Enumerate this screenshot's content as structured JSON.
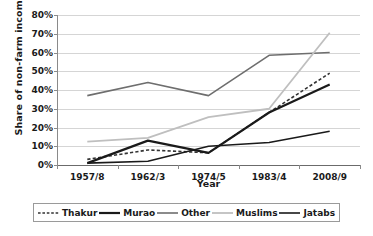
{
  "chart_data": {
    "type": "line",
    "title": "",
    "xlabel": "Year",
    "ylabel": "Share of non-farm income",
    "categories": [
      "1957/8",
      "1962/3",
      "1974/5",
      "1983/4",
      "2008/9"
    ],
    "ylim": [
      0,
      80
    ],
    "ytick_labels": [
      "0%",
      "10%",
      "20%",
      "30%",
      "40%",
      "50%",
      "60%",
      "70%",
      "80%"
    ],
    "ytick_values": [
      0,
      10,
      20,
      30,
      40,
      50,
      60,
      70,
      80
    ],
    "grid": true,
    "legend_position": "bottom",
    "series": [
      {
        "name": "Thakur",
        "style": "dashed",
        "color": "#333333",
        "width": 1.6,
        "values": [
          3,
          8,
          6.5,
          28,
          49
        ]
      },
      {
        "name": "Murao",
        "style": "solid",
        "color": "#1a1a1a",
        "width": 2.2,
        "values": [
          1,
          13,
          6.5,
          28,
          43
        ]
      },
      {
        "name": "Other",
        "style": "solid",
        "color": "#6e6e6e",
        "width": 1.6,
        "values": [
          37,
          44,
          37,
          58.5,
          60
        ]
      },
      {
        "name": "Muslims",
        "style": "solid",
        "color": "#bfbfbf",
        "width": 1.8,
        "values": [
          12.5,
          14.5,
          25.5,
          30,
          70.5
        ]
      },
      {
        "name": "Jatabs",
        "style": "solid",
        "color": "#1a1a1a",
        "width": 1.6,
        "values": [
          1,
          2,
          10,
          12,
          18
        ]
      }
    ]
  },
  "legend": {
    "items": [
      {
        "label": "Thakur"
      },
      {
        "label": "Murao"
      },
      {
        "label": "Other"
      },
      {
        "label": "Muslims"
      },
      {
        "label": "Jatabs"
      }
    ]
  }
}
